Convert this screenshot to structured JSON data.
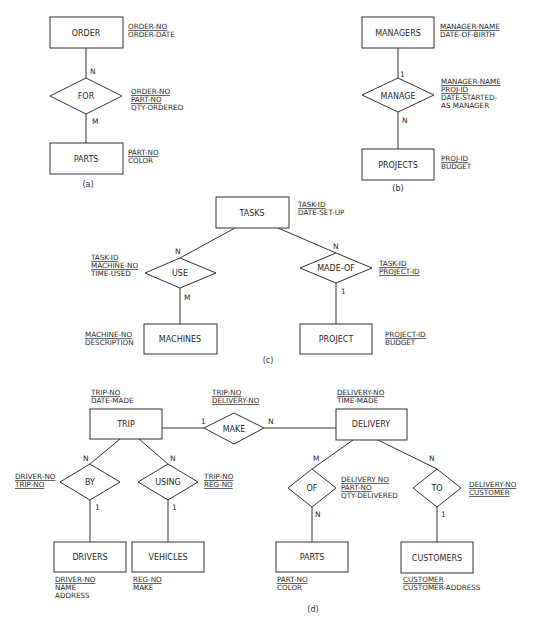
{
  "figure": {
    "panels": {
      "a": {
        "caption": "(a)",
        "entities": {
          "order": {
            "name": "ORDER",
            "attrs": [
              "ORDER-NO",
              "ORDER-DATE"
            ],
            "keys": [
              true,
              false
            ]
          },
          "parts": {
            "name": "PARTS",
            "attrs": [
              "PART-NO",
              "COLOR"
            ],
            "keys": [
              true,
              false
            ]
          }
        },
        "relationship": {
          "name": "FOR",
          "attrs": [
            "ORDER-NO",
            "PART-NO",
            "QTY-ORDERED"
          ],
          "keys": [
            true,
            true,
            false
          ]
        },
        "cardinality": {
          "order_side": "N",
          "parts_side": "M"
        }
      },
      "b": {
        "caption": "(b)",
        "entities": {
          "managers": {
            "name": "MANAGERS",
            "attrs": [
              "MANAGER-NAME",
              "DATE-OF-BIRTH"
            ],
            "keys": [
              true,
              false
            ]
          },
          "projects": {
            "name": "PROJECTS",
            "attrs": [
              "PROJ-ID",
              "BUDGET"
            ],
            "keys": [
              true,
              false
            ]
          }
        },
        "relationship": {
          "name": "MANAGE",
          "attrs": [
            "MANAGER-NAME",
            "PROJ-ID",
            "DATE-STARTED-",
            "AS MANAGER"
          ],
          "keys": [
            true,
            true,
            false,
            false
          ]
        },
        "cardinality": {
          "managers_side": "1",
          "projects_side": "N"
        }
      },
      "c": {
        "caption": "(c)",
        "entities": {
          "tasks": {
            "name": "TASKS",
            "attrs": [
              "TASK-ID",
              "DATE-SET-UP"
            ],
            "keys": [
              true,
              false
            ]
          },
          "machines": {
            "name": "MACHINES",
            "attrs": [
              "MACHINE-NO",
              "DESCRIPTION"
            ],
            "keys": [
              true,
              false
            ]
          },
          "project": {
            "name": "PROJECT",
            "attrs": [
              "PROJECT-ID",
              "BUDGET"
            ],
            "keys": [
              true,
              false
            ]
          }
        },
        "relationships": {
          "use": {
            "name": "USE",
            "attrs": [
              "TASK-ID",
              "MACHINE-NO",
              "TIME-USED"
            ],
            "keys": [
              true,
              true,
              false
            ]
          },
          "made_of": {
            "name": "MADE-OF",
            "attrs": [
              "TASK-ID",
              "PROJECT-ID"
            ],
            "keys": [
              true,
              true
            ]
          }
        },
        "cardinality": {
          "use_tasks": "N",
          "use_machines": "M",
          "madeof_tasks": "N",
          "madeof_project": "1"
        }
      },
      "d": {
        "caption": "(d)",
        "entities": {
          "trip": {
            "name": "TRIP",
            "attrs": [
              "TRIP-NO",
              "DATE-MADE"
            ],
            "keys": [
              true,
              false
            ]
          },
          "delivery": {
            "name": "DELIVERY",
            "attrs": [
              "DELIVERY-NO",
              "TIME-MADE"
            ],
            "keys": [
              true,
              false
            ]
          },
          "drivers": {
            "name": "DRIVERS",
            "attrs": [
              "DRIVER-NO",
              "NAME",
              "ADDRESS"
            ],
            "keys": [
              true,
              false,
              false
            ]
          },
          "vehicles": {
            "name": "VEHICLES",
            "attrs": [
              "REG-NO",
              "MAKE"
            ],
            "keys": [
              true,
              false
            ]
          },
          "parts": {
            "name": "PARTS",
            "attrs": [
              "PART-NO",
              "COLOR"
            ],
            "keys": [
              true,
              false
            ]
          },
          "customers": {
            "name": "CUSTOMERS",
            "attrs": [
              "CUSTOMER",
              "CUSTOMER-ADDRESS"
            ],
            "keys": [
              true,
              false
            ]
          }
        },
        "relationships": {
          "make": {
            "name": "MAKE",
            "attrs": [
              "TRIP-NO",
              "DELIVERY-NO"
            ],
            "keys": [
              true,
              true
            ]
          },
          "by": {
            "name": "BY",
            "attrs": [
              "DRIVER-NO",
              "TRIP-NO"
            ],
            "keys": [
              true,
              true
            ]
          },
          "using": {
            "name": "USING",
            "attrs": [
              "TRIP-NO",
              "REG-NO"
            ],
            "keys": [
              true,
              true
            ]
          },
          "of": {
            "name": "OF",
            "attrs": [
              "DELIVERY NO",
              "PART-NO",
              "QTY-DELIVERED"
            ],
            "keys": [
              true,
              true,
              false
            ]
          },
          "to": {
            "name": "TO",
            "attrs": [
              "DELIVERY-NO",
              "CUSTOMER"
            ],
            "keys": [
              true,
              true
            ]
          }
        },
        "cardinality": {
          "make_trip": "1",
          "make_delivery": "N",
          "by_trip": "N",
          "by_drivers": "1",
          "using_trip": "N",
          "using_vehicles": "1",
          "of_delivery": "M",
          "of_parts": "N",
          "to_delivery": "N",
          "to_customers": "1"
        }
      }
    }
  }
}
